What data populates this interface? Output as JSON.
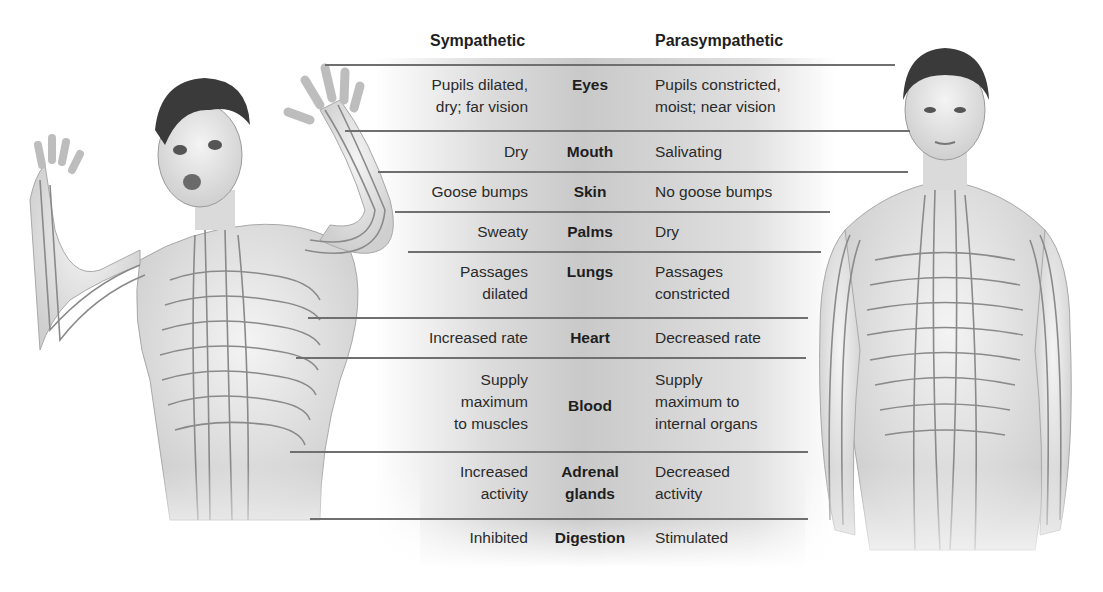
{
  "headers": {
    "sympathetic": "Sympathetic",
    "parasympathetic": "Parasympathetic"
  },
  "figures": {
    "left": {
      "label": "Frightened person with sympathetic nerve pathways",
      "state": "aroused"
    },
    "right": {
      "label": "Calm person with parasympathetic nerve pathways",
      "state": "calm"
    }
  },
  "colors": {
    "line": "#6f6f6f",
    "text": "#2a2a2a",
    "band": "#d0d0d0",
    "nerve": "#8a8a8a",
    "skin": "#e9e9e9",
    "hair": "#3a3a3a"
  },
  "rows": [
    {
      "organ": "Eyes",
      "sympathetic": "Pupils dilated,\ndry; far vision",
      "parasympathetic": "Pupils constricted,\nmoist; near vision"
    },
    {
      "organ": "Mouth",
      "sympathetic": "Dry",
      "parasympathetic": "Salivating"
    },
    {
      "organ": "Skin",
      "sympathetic": "Goose bumps",
      "parasympathetic": "No goose bumps"
    },
    {
      "organ": "Palms",
      "sympathetic": "Sweaty",
      "parasympathetic": "Dry"
    },
    {
      "organ": "Lungs",
      "sympathetic": "Passages\ndilated",
      "parasympathetic": "Passages\nconstricted"
    },
    {
      "organ": "Heart",
      "sympathetic": "Increased rate",
      "parasympathetic": "Decreased rate"
    },
    {
      "organ": "Blood",
      "sympathetic": "Supply\nmaximum\nto muscles",
      "parasympathetic": "Supply\nmaximum to\ninternal organs"
    },
    {
      "organ": "Adrenal\nglands",
      "sympathetic": "Increased\nactivity",
      "parasympathetic": "Decreased\nactivity"
    },
    {
      "organ": "Digestion",
      "sympathetic": "Inhibited",
      "parasympathetic": "Stimulated"
    }
  ]
}
